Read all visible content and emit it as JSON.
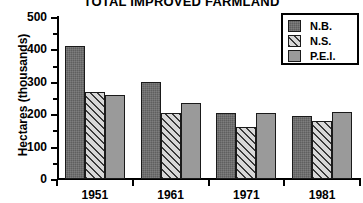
{
  "chart_data": {
    "type": "bar",
    "title": "TOTAL IMPROVED FARMLAND",
    "xlabel": "",
    "ylabel": "Hectares (thousands)",
    "categories": [
      "1951",
      "1961",
      "1971",
      "1981"
    ],
    "series": [
      {
        "name": "N.B.",
        "values": [
          410,
          300,
          203,
          195
        ]
      },
      {
        "name": "N.S.",
        "values": [
          270,
          205,
          160,
          180
        ]
      },
      {
        "name": "P.E.I.",
        "values": [
          260,
          235,
          203,
          207
        ]
      }
    ],
    "ylim": [
      0,
      500
    ],
    "ytick_values": [
      0,
      100,
      200,
      300,
      400,
      500
    ],
    "ytick_labels": [
      "0",
      "100",
      "200",
      "300",
      "400",
      "500"
    ],
    "yminor_values": [
      50,
      150,
      250,
      350,
      450
    ],
    "grid": false,
    "legend_position": "top-right",
    "legend_entries": [
      {
        "label": "N.B.",
        "pattern": "solid-dark-gray",
        "color": "#5f5f5f"
      },
      {
        "label": "N.S.",
        "pattern": "diagonal-hatch",
        "color": "#d2d2d2"
      },
      {
        "label": "P.E.I.",
        "pattern": "solid-mid-gray",
        "color": "#9a9a9a"
      }
    ]
  }
}
